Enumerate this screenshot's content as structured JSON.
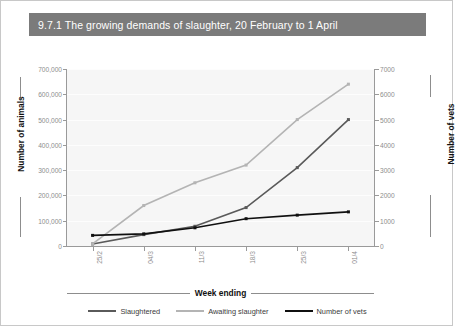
{
  "figure": {
    "title": "9.7.1 The growing demands of slaughter, 20 February to 1 April",
    "title_band_color": "#7b7b7b",
    "title_text_color": "#ffffff",
    "plot_background": "#f6f6f6",
    "page_background": "#ffffff"
  },
  "chart_data": {
    "type": "line",
    "title": "9.7.1 The growing demands of slaughter, 20 February to 1 April",
    "xlabel": "Week ending",
    "ylabel": "Number of animals",
    "ylabel_secondary": "Number of vets",
    "categories": [
      "25/2",
      "04/3",
      "11/3",
      "18/3",
      "25/3",
      "01/4"
    ],
    "ylim": [
      0,
      700000
    ],
    "ylim_secondary": [
      0,
      7000
    ],
    "yticks": [
      0,
      100000,
      200000,
      300000,
      400000,
      500000,
      600000,
      700000
    ],
    "ytick_labels": [
      "0",
      "100,000",
      "200,000",
      "300,000",
      "400,000",
      "500,000",
      "600,000",
      "700,000"
    ],
    "yticks_secondary": [
      0,
      1000,
      2000,
      3000,
      4000,
      5000,
      6000,
      7000
    ],
    "ytick_labels_secondary": [
      "0",
      "1000",
      "2000",
      "3000",
      "4000",
      "5000",
      "6000",
      "7000"
    ],
    "grid": true,
    "legend_position": "bottom",
    "series": [
      {
        "name": "Slaughtered",
        "axis": "left",
        "color": "#5a5a5a",
        "values": [
          8000,
          45000,
          78000,
          152000,
          310000,
          500000
        ]
      },
      {
        "name": "Awaiting slaughter",
        "axis": "left",
        "color": "#b4b4b4",
        "values": [
          8000,
          160000,
          250000,
          320000,
          500000,
          640000
        ]
      },
      {
        "name": "Number of vets",
        "axis": "right",
        "color": "#101010",
        "values": [
          420,
          480,
          720,
          1080,
          1220,
          1350
        ]
      }
    ]
  }
}
